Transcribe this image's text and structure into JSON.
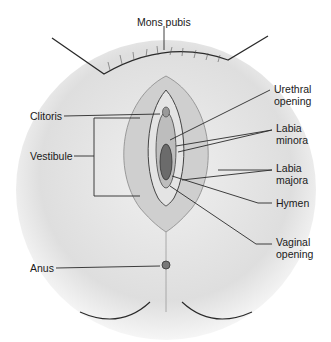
{
  "diagram": {
    "labels": [
      {
        "id": "mons-pubis",
        "text": "Mons pubis",
        "x": 137,
        "y": 16
      },
      {
        "id": "urethral-opening",
        "line1": "Urethral",
        "line2": "opening",
        "x": 274,
        "y": 83
      },
      {
        "id": "clitoris",
        "text": "Clitoris",
        "x": 30,
        "y": 112
      },
      {
        "id": "labia-minora",
        "line1": "Labia",
        "line2": "minora",
        "x": 276,
        "y": 124
      },
      {
        "id": "vestibule",
        "text": "Vestibule",
        "x": 30,
        "y": 152
      },
      {
        "id": "labia-majora",
        "line1": "Labia",
        "line2": "majora",
        "x": 276,
        "y": 163
      },
      {
        "id": "hymen",
        "text": "Hymen",
        "x": 276,
        "y": 197
      },
      {
        "id": "vaginal-opening",
        "line1": "Vaginal",
        "line2": "opening",
        "x": 276,
        "y": 238
      },
      {
        "id": "anus",
        "text": "Anus",
        "x": 34,
        "y": 262
      }
    ],
    "colors": {
      "line": "#2a2a2a",
      "shade": "#b8b8b8",
      "background": "#ffffff"
    }
  }
}
